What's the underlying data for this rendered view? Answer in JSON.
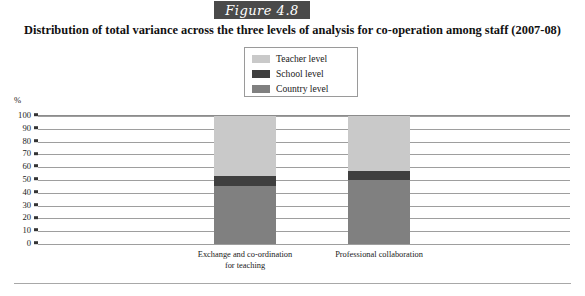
{
  "figure": {
    "tag": "Figure 4.8",
    "title": "Distribution of total variance across the three levels of analysis for co-operation among staff (2007-08)"
  },
  "legend": {
    "position": "top-center",
    "items": [
      {
        "label": "Teacher level",
        "color": "#c9c9c9"
      },
      {
        "label": "School level",
        "color": "#3f3f3f"
      },
      {
        "label": "Country level",
        "color": "#808080"
      }
    ]
  },
  "axis": {
    "y_unit": "%",
    "y_ticks": [
      "100",
      "90",
      "80",
      "70",
      "60",
      "50",
      "40",
      "30",
      "20",
      "10",
      "0"
    ]
  },
  "chart_data": {
    "type": "bar",
    "stacked": true,
    "title": "Distribution of total variance across the three levels of analysis for co-operation among staff (2007-08)",
    "xlabel": "",
    "ylabel": "%",
    "ylim": [
      0,
      100
    ],
    "grid": true,
    "legend_position": "top-center",
    "categories": [
      "Exchange and co-ordination for teaching",
      "Professional collaboration"
    ],
    "series": [
      {
        "name": "Country level",
        "color": "#808080",
        "values": [
          45,
          50
        ]
      },
      {
        "name": "School level",
        "color": "#3f3f3f",
        "values": [
          8,
          7
        ]
      },
      {
        "name": "Teacher level",
        "color": "#c9c9c9",
        "values": [
          47,
          43
        ]
      }
    ]
  },
  "x_axis_labels": [
    {
      "line1": "Exchange and co-ordination",
      "line2": "for teaching"
    },
    {
      "line1": "Professional collaboration",
      "line2": ""
    }
  ]
}
